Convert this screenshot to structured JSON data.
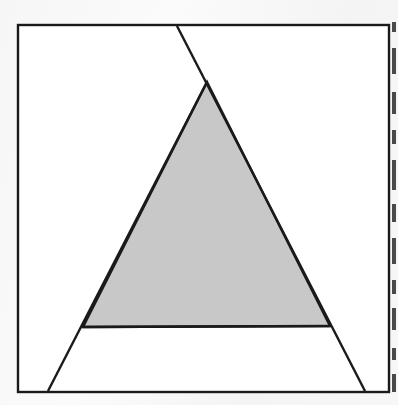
{
  "figure": {
    "background_color": "#f7f7f7",
    "paper_color": "#ffffff",
    "stroke_color": "#1a1a1a",
    "triangle_fill": "#c8c8c8",
    "frame": {
      "label": "square-frame",
      "stroke_width": 2.4,
      "x1": 18,
      "y1": 25,
      "x2": 389,
      "y2": 392
    },
    "triangle": {
      "label": "shaded-triangle",
      "fill": "#c8c8c8",
      "stroke_width": 2.4,
      "apex": {
        "x": 207,
        "y": 82
      },
      "base_left": {
        "x": 83,
        "y": 327
      },
      "base_right": {
        "x": 330,
        "y": 326
      }
    },
    "lines": [
      {
        "name": "left-side-extended",
        "from": {
          "x": 207,
          "y": 82
        },
        "to": {
          "x": 48,
          "y": 391
        },
        "stroke_width": 2.4
      },
      {
        "name": "right-side-extended",
        "from": {
          "x": 177,
          "y": 26
        },
        "to": {
          "x": 365,
          "y": 391
        },
        "stroke_width": 2.4
      },
      {
        "name": "horizontal-base-line",
        "from": {
          "x": 83,
          "y": 327
        },
        "to": {
          "x": 330,
          "y": 326
        },
        "stroke_width": 2.4
      }
    ],
    "intersections": [
      {
        "name": "top-border-crossing",
        "x": 177,
        "y": 26
      },
      {
        "name": "bottom-border-crossing-left",
        "x": 48,
        "y": 391
      },
      {
        "name": "bottom-border-crossing-right",
        "x": 365,
        "y": 391
      }
    ],
    "edge_artifact": {
      "name": "page-edge-scan-marks",
      "color": "#2b2b2b",
      "x": 392,
      "marks": [
        {
          "top": 22,
          "height": 10
        },
        {
          "top": 48,
          "height": 26
        },
        {
          "top": 92,
          "height": 22
        },
        {
          "top": 130,
          "height": 14
        },
        {
          "top": 160,
          "height": 30
        },
        {
          "top": 204,
          "height": 18
        },
        {
          "top": 238,
          "height": 26
        },
        {
          "top": 280,
          "height": 14
        },
        {
          "top": 308,
          "height": 22
        },
        {
          "top": 348,
          "height": 12
        },
        {
          "top": 374,
          "height": 18
        }
      ]
    }
  }
}
